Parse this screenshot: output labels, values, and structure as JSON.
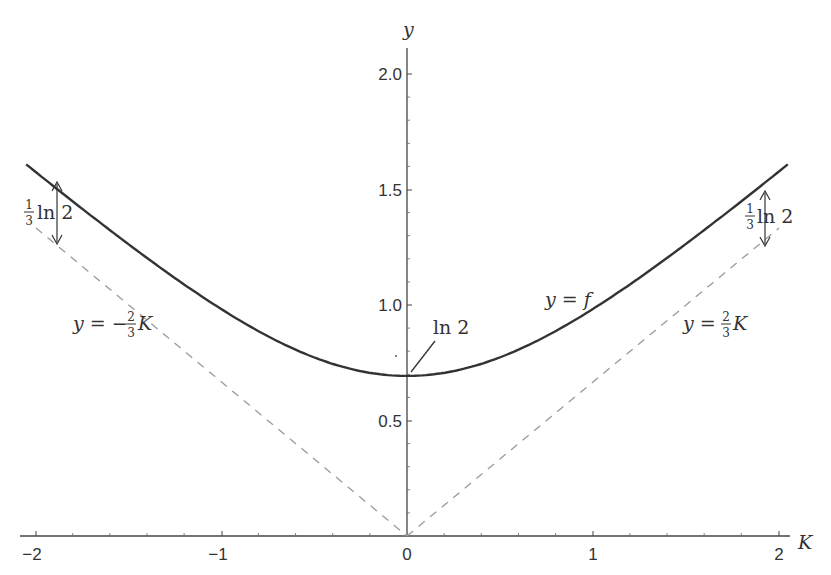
{
  "chart_data": {
    "type": "line",
    "title": "",
    "xlabel": "K",
    "ylabel": "y",
    "xlim": [
      -2,
      2
    ],
    "ylim": [
      0,
      2.1
    ],
    "grid": false,
    "x_ticks": [
      -2,
      -1,
      0,
      1,
      2
    ],
    "x_tick_labels": [
      "−2",
      "−1",
      "0",
      "1",
      "2"
    ],
    "y_ticks": [
      0.5,
      1.0,
      1.5,
      2.0
    ],
    "y_tick_labels": [
      "0.5",
      "1.0",
      "1.5",
      "2.0"
    ],
    "series": [
      {
        "name": "y = f",
        "style": "solid",
        "color": "#333333",
        "formula": "ln 2 + (2/3) ln cosh K",
        "x": [
          -2,
          -1.5,
          -1,
          -0.5,
          0,
          0.5,
          1,
          1.5,
          2
        ],
        "values": [
          1.577,
          1.34,
          1.0,
          0.774,
          0.693,
          0.774,
          1.0,
          1.34,
          1.577
        ]
      },
      {
        "name": "y = −(2/3)K",
        "style": "dashed",
        "color": "#999999",
        "x": [
          -2,
          0
        ],
        "values": [
          1.333,
          0
        ]
      },
      {
        "name": "y = (2/3)K",
        "style": "dashed",
        "color": "#999999",
        "x": [
          0,
          2
        ],
        "values": [
          0,
          1.333
        ]
      }
    ],
    "annotations": [
      {
        "text": "ln 2",
        "at": [
          0,
          0.693
        ]
      },
      {
        "text": "(1/3) ln 2",
        "at": [
          -1.9,
          1.45
        ],
        "type": "gap-arrow"
      },
      {
        "text": "(1/3) ln 2",
        "at": [
          1.9,
          1.45
        ],
        "type": "gap-arrow"
      },
      {
        "text": "y = f",
        "at": [
          0.75,
          0.93
        ]
      },
      {
        "text": "y = −(2/3)K",
        "at": [
          -1.7,
          0.9
        ]
      },
      {
        "text": "y = (2/3)K",
        "at": [
          1.5,
          0.9
        ]
      }
    ]
  },
  "labels": {
    "x_axis": "K",
    "y_axis": "y",
    "x_ticks": [
      "−2",
      "−1",
      "0",
      "1",
      "2"
    ],
    "y_ticks": [
      "0.5",
      "1.0",
      "1.5",
      "2.0"
    ],
    "ln2": "ln 2",
    "gap_frac_num": "1",
    "gap_frac_den": "3",
    "gap_ln2": "ln 2",
    "curve_label": "y = f",
    "left_line_lhs": "y = −",
    "right_line_lhs": "y = ",
    "line_frac_num": "2",
    "line_frac_den": "3",
    "line_var": "K"
  }
}
